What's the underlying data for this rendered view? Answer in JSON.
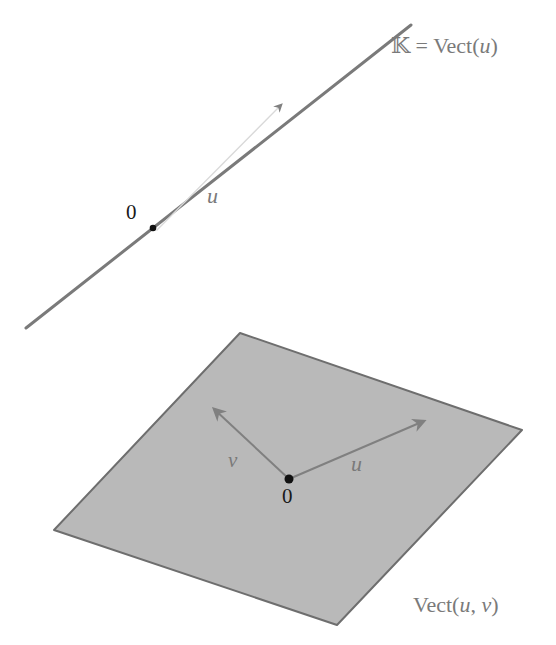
{
  "figure": {
    "line_diagram": {
      "line_label_prefix": "𝕂 = Vect(",
      "line_label_var": "u",
      "line_label_suffix": ")",
      "origin_label": "0",
      "vector_label": "u",
      "line": {
        "x1": 26,
        "y1": 328,
        "x2": 411,
        "y2": 25
      },
      "origin": {
        "x": 153,
        "y": 228
      },
      "vector_tip": {
        "x": 281,
        "y": 104
      }
    },
    "plane_diagram": {
      "plane_label_prefix": "Vect(",
      "plane_label_u": "u",
      "plane_label_sep": ", ",
      "plane_label_v": "v",
      "plane_label_suffix": ")",
      "origin_label": "0",
      "vector_u_label": "u",
      "vector_v_label": "v",
      "corners": {
        "top": {
          "x": 240,
          "y": 333
        },
        "right": {
          "x": 522,
          "y": 430
        },
        "bottom": {
          "x": 337,
          "y": 625
        },
        "left": {
          "x": 54,
          "y": 530
        }
      },
      "origin": {
        "x": 289,
        "y": 479
      },
      "u_tip": {
        "x": 425,
        "y": 421
      },
      "v_tip": {
        "x": 213,
        "y": 408
      }
    },
    "colors": {
      "line": "#7a7a7a",
      "plane_fill": "#b9b9b9",
      "plane_edge": "#6e6e6e",
      "vector": "#808080",
      "point": "#111111",
      "label_gray": "#7a7a7a",
      "label_dark": "#1a1a1a"
    }
  }
}
